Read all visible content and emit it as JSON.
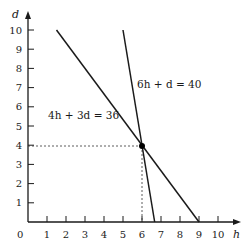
{
  "chart_data": {
    "type": "line",
    "title": "",
    "xlabel": "h",
    "ylabel": "d",
    "xlim": [
      0,
      10
    ],
    "ylim": [
      0,
      10
    ],
    "x_ticks": [
      "0",
      "1",
      "2",
      "3",
      "4",
      "5",
      "6",
      "7",
      "8",
      "9",
      "10"
    ],
    "y_ticks": [
      "1",
      "2",
      "3",
      "4",
      "5",
      "6",
      "7",
      "8",
      "9",
      "10"
    ],
    "grid": false,
    "series": [
      {
        "name": "4h + 3d = 36",
        "x": [
          1.5,
          9
        ],
        "y": [
          10,
          0
        ]
      },
      {
        "name": "6h + d = 40",
        "x": [
          5,
          6.667
        ],
        "y": [
          10,
          0
        ]
      }
    ],
    "annotations": [
      {
        "type": "point",
        "x": 6,
        "y": 4,
        "label": "intersection"
      },
      {
        "type": "dashed-guide",
        "from": [
          0,
          4
        ],
        "to": [
          6,
          4
        ]
      },
      {
        "type": "dashed-guide",
        "from": [
          6,
          0
        ],
        "to": [
          6,
          4
        ]
      }
    ],
    "labels": {
      "line1": "4h + 3d = 36",
      "line2": "6h + d = 40",
      "origin": "0"
    }
  }
}
